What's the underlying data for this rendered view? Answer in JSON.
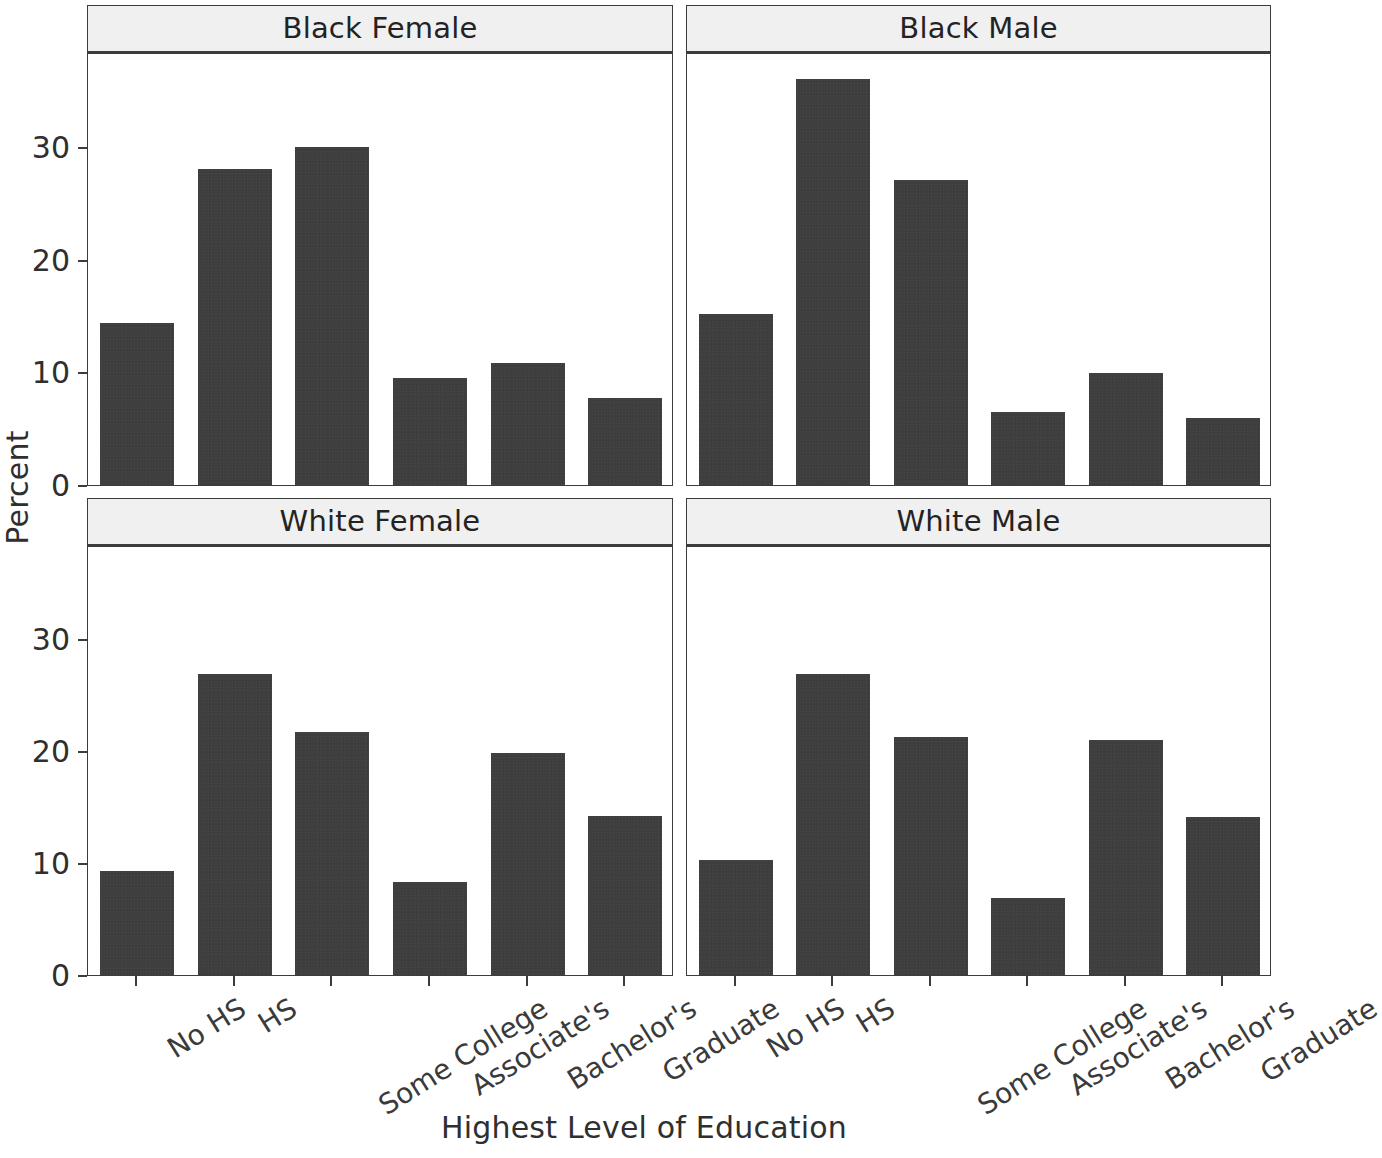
{
  "chart_data": {
    "type": "bar",
    "title": "",
    "xlabel": "Highest Level of Education",
    "ylabel": "Percent",
    "categories": [
      "No HS",
      "HS",
      "Some College",
      "Associate's",
      "Bachelor's",
      "Graduate"
    ],
    "ylim": [
      0,
      38.5
    ],
    "yticks": [
      0,
      10,
      20,
      30
    ],
    "ytick_labels": [
      "0",
      "10",
      "20",
      "30"
    ],
    "grid": false,
    "legend": "none",
    "facet_layout": "2x2",
    "bar_color": "#3f3f3f",
    "strip_color": "#f0f0f0",
    "panels": [
      {
        "id": "black-female",
        "title": "Black Female",
        "row": 0,
        "col": 0,
        "values": [
          14.4,
          28.0,
          30.0,
          9.5,
          10.8,
          7.7
        ]
      },
      {
        "id": "black-male",
        "title": "Black Male",
        "row": 0,
        "col": 1,
        "values": [
          15.2,
          36.0,
          27.1,
          6.5,
          9.9,
          5.9
        ]
      },
      {
        "id": "white-female",
        "title": "White Female",
        "row": 1,
        "col": 0,
        "values": [
          9.3,
          26.9,
          21.7,
          8.3,
          19.8,
          14.2
        ]
      },
      {
        "id": "white-male",
        "title": "White Male",
        "row": 1,
        "col": 1,
        "values": [
          10.3,
          26.9,
          21.3,
          6.9,
          21.0,
          14.1
        ]
      }
    ]
  }
}
